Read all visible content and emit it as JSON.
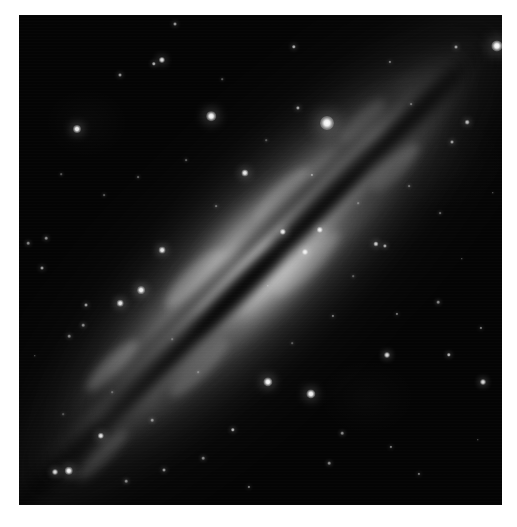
{
  "image": {
    "kind": "astronomical-photograph",
    "subject": "edge-on spiral galaxy",
    "color_mode": "grayscale",
    "border_color": "#ffffff",
    "sky_color": "#040404",
    "galaxy_color": "#e8e8e8",
    "dust_lane_color": "#000000",
    "star_color": "#ffffff",
    "frame": {
      "left": 19,
      "top": 15,
      "width": 483,
      "height": 490
    },
    "galaxy": {
      "position_angle_deg": -45,
      "center_x": 241,
      "center_y": 245,
      "major_axis_px": 880,
      "minor_axis_px": 300,
      "dust_lane_offset_px": 6,
      "description": "bright elongated disk bisected by a dark dust lane running from lower-left to upper-right"
    },
    "stars": [
      {
        "x": 327,
        "y": 123,
        "r": 7.0,
        "b": 1.0
      },
      {
        "x": 497,
        "y": 46,
        "r": 5.6,
        "b": 1.0
      },
      {
        "x": 211,
        "y": 116,
        "r": 4.8,
        "b": 0.98
      },
      {
        "x": 268,
        "y": 382,
        "r": 4.6,
        "b": 0.98
      },
      {
        "x": 311,
        "y": 394,
        "r": 4.6,
        "b": 0.98
      },
      {
        "x": 69,
        "y": 471,
        "r": 4.2,
        "b": 0.96
      },
      {
        "x": 77,
        "y": 129,
        "r": 4.0,
        "b": 0.95
      },
      {
        "x": 141,
        "y": 290,
        "r": 3.9,
        "b": 0.95
      },
      {
        "x": 162,
        "y": 250,
        "r": 3.4,
        "b": 0.92
      },
      {
        "x": 120,
        "y": 303,
        "r": 3.3,
        "b": 0.92
      },
      {
        "x": 245,
        "y": 173,
        "r": 3.6,
        "b": 0.93
      },
      {
        "x": 283,
        "y": 232,
        "r": 3.2,
        "b": 0.9
      },
      {
        "x": 320,
        "y": 230,
        "r": 3.2,
        "b": 0.9
      },
      {
        "x": 305,
        "y": 252,
        "r": 3.0,
        "b": 0.88
      },
      {
        "x": 162,
        "y": 60,
        "r": 3.1,
        "b": 0.89
      },
      {
        "x": 55,
        "y": 472,
        "r": 3.0,
        "b": 0.88
      },
      {
        "x": 101,
        "y": 436,
        "r": 3.2,
        "b": 0.9
      },
      {
        "x": 154,
        "y": 64,
        "r": 2.2,
        "b": 0.7
      },
      {
        "x": 387,
        "y": 355,
        "r": 3.0,
        "b": 0.88
      },
      {
        "x": 449,
        "y": 355,
        "r": 2.2,
        "b": 0.72
      },
      {
        "x": 483,
        "y": 382,
        "r": 3.0,
        "b": 0.88
      },
      {
        "x": 376,
        "y": 244,
        "r": 2.6,
        "b": 0.8
      },
      {
        "x": 385,
        "y": 246,
        "r": 2.1,
        "b": 0.66
      },
      {
        "x": 467,
        "y": 122,
        "r": 2.3,
        "b": 0.74
      },
      {
        "x": 452,
        "y": 142,
        "r": 2.0,
        "b": 0.62
      },
      {
        "x": 456,
        "y": 47,
        "r": 2.0,
        "b": 0.62
      },
      {
        "x": 298,
        "y": 108,
        "r": 2.1,
        "b": 0.66
      },
      {
        "x": 294,
        "y": 47,
        "r": 2.2,
        "b": 0.7
      },
      {
        "x": 175,
        "y": 24,
        "r": 2.0,
        "b": 0.6
      },
      {
        "x": 120,
        "y": 75,
        "r": 2.0,
        "b": 0.6
      },
      {
        "x": 42,
        "y": 268,
        "r": 2.0,
        "b": 0.62
      },
      {
        "x": 86,
        "y": 305,
        "r": 2.0,
        "b": 0.62
      },
      {
        "x": 46,
        "y": 238,
        "r": 1.8,
        "b": 0.56
      },
      {
        "x": 28,
        "y": 243,
        "r": 1.8,
        "b": 0.54
      },
      {
        "x": 69,
        "y": 336,
        "r": 1.8,
        "b": 0.54
      },
      {
        "x": 83,
        "y": 325,
        "r": 1.8,
        "b": 0.54
      },
      {
        "x": 152,
        "y": 420,
        "r": 1.8,
        "b": 0.54
      },
      {
        "x": 164,
        "y": 470,
        "r": 2.0,
        "b": 0.6
      },
      {
        "x": 126,
        "y": 481,
        "r": 1.8,
        "b": 0.54
      },
      {
        "x": 203,
        "y": 458,
        "r": 1.8,
        "b": 0.54
      },
      {
        "x": 233,
        "y": 430,
        "r": 2.2,
        "b": 0.72
      },
      {
        "x": 249,
        "y": 487,
        "r": 1.6,
        "b": 0.48
      },
      {
        "x": 342,
        "y": 433,
        "r": 1.8,
        "b": 0.54
      },
      {
        "x": 329,
        "y": 463,
        "r": 1.8,
        "b": 0.54
      },
      {
        "x": 391,
        "y": 447,
        "r": 1.6,
        "b": 0.48
      },
      {
        "x": 419,
        "y": 474,
        "r": 1.6,
        "b": 0.46
      },
      {
        "x": 481,
        "y": 328,
        "r": 1.6,
        "b": 0.48
      },
      {
        "x": 438,
        "y": 302,
        "r": 1.8,
        "b": 0.54
      },
      {
        "x": 397,
        "y": 314,
        "r": 1.6,
        "b": 0.46
      },
      {
        "x": 333,
        "y": 316,
        "r": 1.6,
        "b": 0.46
      },
      {
        "x": 312,
        "y": 175,
        "r": 1.6,
        "b": 0.46
      },
      {
        "x": 390,
        "y": 62,
        "r": 1.6,
        "b": 0.46
      },
      {
        "x": 411,
        "y": 104,
        "r": 1.4,
        "b": 0.4
      },
      {
        "x": 440,
        "y": 213,
        "r": 1.4,
        "b": 0.4
      },
      {
        "x": 409,
        "y": 186,
        "r": 1.4,
        "b": 0.4
      },
      {
        "x": 216,
        "y": 206,
        "r": 1.4,
        "b": 0.4
      },
      {
        "x": 186,
        "y": 160,
        "r": 1.4,
        "b": 0.38
      },
      {
        "x": 138,
        "y": 177,
        "r": 1.4,
        "b": 0.38
      },
      {
        "x": 104,
        "y": 195,
        "r": 1.4,
        "b": 0.36
      },
      {
        "x": 61,
        "y": 174,
        "r": 1.3,
        "b": 0.34
      },
      {
        "x": 222,
        "y": 79,
        "r": 1.3,
        "b": 0.34
      },
      {
        "x": 266,
        "y": 140,
        "r": 1.3,
        "b": 0.34
      },
      {
        "x": 358,
        "y": 203,
        "r": 1.3,
        "b": 0.34
      },
      {
        "x": 353,
        "y": 276,
        "r": 1.3,
        "b": 0.34
      },
      {
        "x": 292,
        "y": 343,
        "r": 1.3,
        "b": 0.32
      },
      {
        "x": 198,
        "y": 372,
        "r": 1.3,
        "b": 0.32
      },
      {
        "x": 172,
        "y": 339,
        "r": 1.3,
        "b": 0.32
      },
      {
        "x": 112,
        "y": 392,
        "r": 1.3,
        "b": 0.32
      },
      {
        "x": 63,
        "y": 414,
        "r": 1.3,
        "b": 0.3
      },
      {
        "x": 35,
        "y": 356,
        "r": 1.2,
        "b": 0.3
      },
      {
        "x": 462,
        "y": 259,
        "r": 1.2,
        "b": 0.3
      },
      {
        "x": 493,
        "y": 193,
        "r": 1.2,
        "b": 0.3
      },
      {
        "x": 478,
        "y": 440,
        "r": 1.2,
        "b": 0.28
      },
      {
        "x": 268,
        "y": 286,
        "r": 1.2,
        "b": 0.3
      }
    ],
    "dust_clouds": [
      {
        "x": -300,
        "y": 2,
        "w": 150,
        "h": 17,
        "o": 0.55
      },
      {
        "x": -150,
        "y": -4,
        "w": 140,
        "h": 15,
        "o": 0.5
      },
      {
        "x": -40,
        "y": 5,
        "w": 120,
        "h": 18,
        "o": 0.6
      },
      {
        "x": 90,
        "y": -2,
        "w": 150,
        "h": 16,
        "o": 0.55
      },
      {
        "x": 215,
        "y": 6,
        "w": 130,
        "h": 19,
        "o": 0.5
      },
      {
        "x": -230,
        "y": -22,
        "w": 100,
        "h": 11,
        "o": 0.38
      },
      {
        "x": 40,
        "y": -24,
        "w": 110,
        "h": 12,
        "o": 0.4
      },
      {
        "x": 175,
        "y": -27,
        "w": 95,
        "h": 11,
        "o": 0.34
      },
      {
        "x": -110,
        "y": 26,
        "w": 120,
        "h": 13,
        "o": 0.34
      },
      {
        "x": 120,
        "y": 29,
        "w": 110,
        "h": 12,
        "o": 0.3
      }
    ],
    "bright_knots": [
      {
        "x": -180,
        "y": -30,
        "w": 70,
        "h": 20,
        "o": 0.22
      },
      {
        "x": -60,
        "y": -34,
        "w": 80,
        "h": 22,
        "o": 0.26
      },
      {
        "x": 60,
        "y": -31,
        "w": 75,
        "h": 20,
        "o": 0.24
      },
      {
        "x": 170,
        "y": -26,
        "w": 60,
        "h": 17,
        "o": 0.18
      },
      {
        "x": -120,
        "y": 32,
        "w": 80,
        "h": 20,
        "o": 0.2
      },
      {
        "x": 30,
        "y": 35,
        "w": 90,
        "h": 22,
        "o": 0.22
      },
      {
        "x": 160,
        "y": 30,
        "w": 65,
        "h": 18,
        "o": 0.16
      },
      {
        "x": -250,
        "y": 26,
        "w": 70,
        "h": 16,
        "o": 0.14
      }
    ]
  }
}
